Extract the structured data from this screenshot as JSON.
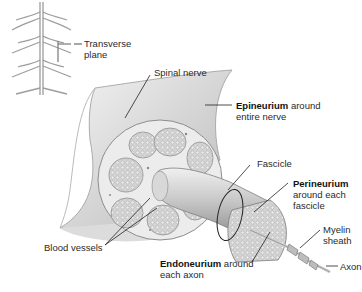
{
  "diagram": {
    "labels": {
      "transverse_plane": [
        "Transverse",
        "plane"
      ],
      "spinal_nerve": "Spinal nerve",
      "epineurium": {
        "term": "Epineurium",
        "rest": " around",
        "line2": "entire nerve"
      },
      "fascicle": "Fascicle",
      "perineurium": {
        "term": "Perineurium",
        "line2": "around each",
        "line3": "fascicle"
      },
      "myelin_sheath": [
        "Myelin",
        "sheath"
      ],
      "blood_vessels": "Blood vessels",
      "endoneurium": {
        "term": "Endoneurium",
        "rest": " around",
        "line2": "each axon"
      },
      "axon": "Axon"
    },
    "colors": {
      "background": "#ffffff",
      "tissue_light": "#e6e6e6",
      "tissue_mid": "#c9c9c9",
      "tissue_dark": "#9a9a9a",
      "leader_line": "#222222"
    }
  }
}
